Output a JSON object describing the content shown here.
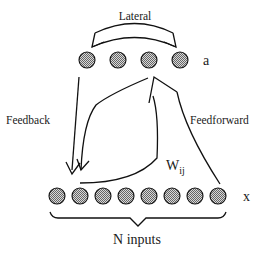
{
  "diagram": {
    "labels": {
      "lateral": "Lateral",
      "output_layer": "a",
      "input_layer": "x",
      "feedback": "Feedback",
      "feedforward": "Feedforward",
      "weights_main": "W",
      "weights_sub": "ij",
      "inputs": "N inputs"
    },
    "output_nodes": [
      {
        "cx": 87,
        "cy": 60
      },
      {
        "cx": 118,
        "cy": 60
      },
      {
        "cx": 149,
        "cy": 60
      },
      {
        "cx": 180,
        "cy": 60
      }
    ],
    "input_nodes": [
      {
        "cx": 57,
        "cy": 196
      },
      {
        "cx": 80,
        "cy": 196
      },
      {
        "cx": 103,
        "cy": 196
      },
      {
        "cx": 126,
        "cy": 196
      },
      {
        "cx": 149,
        "cy": 196
      },
      {
        "cx": 172,
        "cy": 196
      },
      {
        "cx": 195,
        "cy": 196
      },
      {
        "cx": 218,
        "cy": 196
      }
    ],
    "node_fill_color": "#a8a8a8",
    "line_color": "#111111"
  }
}
